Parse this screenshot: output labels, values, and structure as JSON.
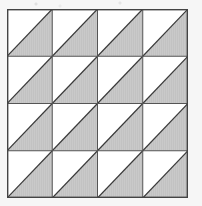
{
  "figure": {
    "title": "",
    "caption": "",
    "type": "geometric-tiling"
  },
  "colors": {
    "background": "#f6f6f6",
    "cell_fill": "#ffffff",
    "shaded_fill": "#c8c8c8",
    "grid_line": "#555555",
    "frame_line": "#444444",
    "diagonal_line": "#3a3a3a"
  },
  "geometry": {
    "frame": {
      "x": 7,
      "y": 9,
      "width": 181,
      "height": 189
    },
    "columns": 4,
    "rows": 4,
    "cell_width": 45.25,
    "cell_height": 47.25,
    "grid_line_width": 1,
    "frame_line_width": 1.4,
    "diagonal_line_width": 1.2,
    "diagonal_direction": "bottom-left-to-top-right",
    "shaded_half": "lower-right"
  },
  "chart_data": {
    "type": "table",
    "title": "",
    "xlabel": "",
    "ylabel": "",
    "columns": [
      "col 1",
      "col 2",
      "col 3",
      "col 4"
    ],
    "rows": [
      "row 1",
      "row 2",
      "row 3",
      "row 4"
    ],
    "legend": [],
    "grid": true,
    "cells": [
      {
        "row": 0,
        "col": 0,
        "diagonal": "bottom-left-to-top-right",
        "shaded_half": "lower-right"
      },
      {
        "row": 0,
        "col": 1,
        "diagonal": "bottom-left-to-top-right",
        "shaded_half": "lower-right"
      },
      {
        "row": 0,
        "col": 2,
        "diagonal": "bottom-left-to-top-right",
        "shaded_half": "lower-right"
      },
      {
        "row": 0,
        "col": 3,
        "diagonal": "bottom-left-to-top-right",
        "shaded_half": "lower-right"
      },
      {
        "row": 1,
        "col": 0,
        "diagonal": "bottom-left-to-top-right",
        "shaded_half": "lower-right"
      },
      {
        "row": 1,
        "col": 1,
        "diagonal": "bottom-left-to-top-right",
        "shaded_half": "lower-right"
      },
      {
        "row": 1,
        "col": 2,
        "diagonal": "bottom-left-to-top-right",
        "shaded_half": "lower-right"
      },
      {
        "row": 1,
        "col": 3,
        "diagonal": "bottom-left-to-top-right",
        "shaded_half": "lower-right"
      },
      {
        "row": 2,
        "col": 0,
        "diagonal": "bottom-left-to-top-right",
        "shaded_half": "lower-right"
      },
      {
        "row": 2,
        "col": 1,
        "diagonal": "bottom-left-to-top-right",
        "shaded_half": "lower-right"
      },
      {
        "row": 2,
        "col": 2,
        "diagonal": "bottom-left-to-top-right",
        "shaded_half": "lower-right"
      },
      {
        "row": 2,
        "col": 3,
        "diagonal": "bottom-left-to-top-right",
        "shaded_half": "lower-right"
      },
      {
        "row": 3,
        "col": 0,
        "diagonal": "bottom-left-to-top-right",
        "shaded_half": "lower-right"
      },
      {
        "row": 3,
        "col": 1,
        "diagonal": "bottom-left-to-top-right",
        "shaded_half": "lower-right"
      },
      {
        "row": 3,
        "col": 2,
        "diagonal": "bottom-left-to-top-right",
        "shaded_half": "lower-right"
      },
      {
        "row": 3,
        "col": 3,
        "diagonal": "bottom-left-to-top-right",
        "shaded_half": "lower-right"
      }
    ],
    "counts": {
      "total_cells": 16,
      "shaded_triangles": 16,
      "unshaded_triangles": 16
    }
  }
}
